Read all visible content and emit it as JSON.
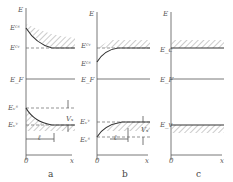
{
  "figure": {
    "panels": [
      {
        "id": "a",
        "caption": "a",
        "y_axis_label": "E",
        "x_axis_label": "x",
        "origin_label": "0",
        "levels": [
          "E_c^s",
          "E_c^v",
          "E_F",
          "E_v^s",
          "E_v^v"
        ],
        "labels": {
          "ecs": "Eᶜˢ",
          "ecv": "Eᶜᵛ",
          "ef": "E_F",
          "evs": "Eᵥˢ",
          "evv": "Eᵥᵛ",
          "vs": "Vₛ",
          "l": "ℓ"
        }
      },
      {
        "id": "b",
        "caption": "b",
        "y_axis_label": "E",
        "x_axis_label": "x",
        "origin_label": "0",
        "labels": {
          "ecv": "Eᶜᵛ",
          "ecs": "Eᶜˢ",
          "ef": "E_F",
          "evv": "Eᵥᵛ",
          "evs": "Eᵥˢ",
          "vs": "Vₛ",
          "l": "ℓ"
        }
      },
      {
        "id": "c",
        "caption": "c",
        "y_axis_label": "E",
        "x_axis_label": "x",
        "origin_label": "0",
        "labels": {
          "ec": "E_c",
          "ef": "E_F",
          "ev": "E_v"
        }
      }
    ]
  }
}
